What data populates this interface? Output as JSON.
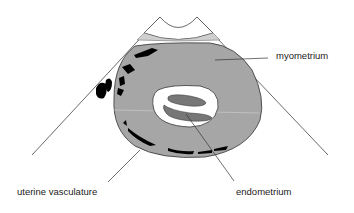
{
  "diagram": {
    "labels": {
      "myometrium": "myometrium",
      "endometrium": "endometrium",
      "uterine_vasculature": "uterine vasculature"
    },
    "colors": {
      "myometrium_fill": "#a6a6a6",
      "endometrium_fill": "#777777",
      "cavity_fill": "#ffffff",
      "vessels_fill": "#000000",
      "transducer_band": "#cfcfcf",
      "line": "#333333"
    }
  }
}
